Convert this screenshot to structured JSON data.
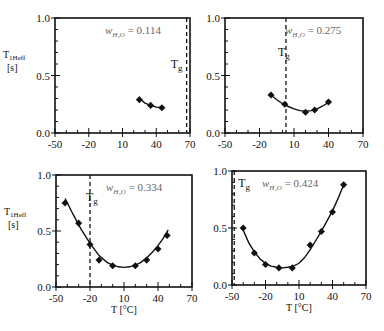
{
  "chart_data": [
    {
      "type": "scatter",
      "panel": "top-left",
      "annotation": "w_H2O = 0.114",
      "ylabel": "T1Heff [s]",
      "xlabel": "",
      "xticks": [
        "-50",
        "-20",
        "10",
        "40",
        "70"
      ],
      "yticks": [
        "0.0",
        "0.5",
        "1.0"
      ],
      "xlim": [
        -50,
        70
      ],
      "ylim": [
        0,
        1.0
      ],
      "tg_label": "Tg",
      "tg_x": 67,
      "points": [
        [
          25,
          0.29
        ],
        [
          35,
          0.24
        ],
        [
          45,
          0.22
        ]
      ],
      "fit": [
        [
          25,
          0.3
        ],
        [
          30,
          0.26
        ],
        [
          35,
          0.24
        ],
        [
          40,
          0.225
        ],
        [
          45,
          0.22
        ]
      ]
    },
    {
      "type": "scatter",
      "panel": "top-right",
      "annotation": "w_H2O = 0.275",
      "ylabel": "",
      "xlabel": "",
      "xticks": [
        "-50",
        "-20",
        "10",
        "40",
        "70"
      ],
      "yticks": [
        "0.0",
        "0.5",
        "1.0"
      ],
      "xlim": [
        -50,
        70
      ],
      "ylim": [
        0,
        1.0
      ],
      "tg_label": "Tg",
      "tg_x": 3,
      "points": [
        [
          -10,
          0.33
        ],
        [
          2,
          0.25
        ],
        [
          20,
          0.18
        ],
        [
          28,
          0.2
        ],
        [
          40,
          0.27
        ]
      ],
      "fit": [
        [
          -10,
          0.33
        ],
        [
          -5,
          0.29
        ],
        [
          0,
          0.255
        ],
        [
          5,
          0.23
        ],
        [
          10,
          0.21
        ],
        [
          15,
          0.195
        ],
        [
          20,
          0.19
        ],
        [
          25,
          0.195
        ],
        [
          30,
          0.21
        ],
        [
          35,
          0.235
        ],
        [
          42,
          0.28
        ]
      ]
    },
    {
      "type": "scatter",
      "panel": "bottom-left",
      "annotation": "w_H2O = 0.334",
      "ylabel": "T1Heff [s]",
      "xlabel": "T [°C]",
      "xticks": [
        "-50",
        "-20",
        "10",
        "40",
        "70"
      ],
      "yticks": [
        "0.0",
        "0.5",
        "1.0"
      ],
      "xlim": [
        -50,
        70
      ],
      "ylim": [
        0,
        1.0
      ],
      "tg_label": "Tg",
      "tg_x": -20,
      "points": [
        [
          -42,
          0.75
        ],
        [
          -30,
          0.57
        ],
        [
          -20,
          0.38
        ],
        [
          -12,
          0.24
        ],
        [
          0,
          0.19
        ],
        [
          20,
          0.19
        ],
        [
          30,
          0.24
        ],
        [
          40,
          0.34
        ],
        [
          48,
          0.46
        ]
      ],
      "fit": [
        [
          -42,
          0.79
        ],
        [
          -35,
          0.65
        ],
        [
          -28,
          0.52
        ],
        [
          -20,
          0.39
        ],
        [
          -12,
          0.28
        ],
        [
          -5,
          0.22
        ],
        [
          0,
          0.195
        ],
        [
          5,
          0.18
        ],
        [
          10,
          0.175
        ],
        [
          15,
          0.18
        ],
        [
          20,
          0.195
        ],
        [
          25,
          0.22
        ],
        [
          30,
          0.26
        ],
        [
          35,
          0.31
        ],
        [
          40,
          0.37
        ],
        [
          45,
          0.44
        ],
        [
          49,
          0.51
        ]
      ]
    },
    {
      "type": "scatter",
      "panel": "bottom-right",
      "annotation": "w_H2O = 0.424",
      "ylabel": "",
      "xlabel": "T [°C]",
      "xticks": [
        "-50",
        "-20",
        "10",
        "40",
        "70"
      ],
      "yticks": [
        "0.0",
        "0.5",
        "1.0"
      ],
      "xlim": [
        -50,
        70
      ],
      "ylim": [
        0,
        1.0
      ],
      "tg_label": "Tg",
      "tg_x": -48,
      "points": [
        [
          -40,
          0.5
        ],
        [
          -30,
          0.28
        ],
        [
          -20,
          0.18
        ],
        [
          -8,
          0.15
        ],
        [
          4,
          0.15
        ],
        [
          20,
          0.35
        ],
        [
          30,
          0.47
        ],
        [
          40,
          0.64
        ],
        [
          50,
          0.88
        ]
      ],
      "fit": [
        [
          -40,
          0.48
        ],
        [
          -35,
          0.37
        ],
        [
          -30,
          0.29
        ],
        [
          -25,
          0.23
        ],
        [
          -20,
          0.19
        ],
        [
          -15,
          0.165
        ],
        [
          -10,
          0.155
        ],
        [
          -5,
          0.15
        ],
        [
          0,
          0.155
        ],
        [
          5,
          0.165
        ],
        [
          10,
          0.19
        ],
        [
          15,
          0.24
        ],
        [
          20,
          0.31
        ],
        [
          25,
          0.39
        ],
        [
          30,
          0.47
        ],
        [
          35,
          0.56
        ],
        [
          40,
          0.65
        ],
        [
          45,
          0.76
        ],
        [
          50,
          0.88
        ]
      ]
    }
  ]
}
